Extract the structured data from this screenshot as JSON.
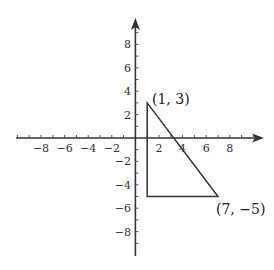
{
  "diagram": {
    "type": "coordinate-plane",
    "x_axis": {
      "range": [
        -9,
        9
      ],
      "tick_labels": [
        "−8",
        "−6",
        "−4",
        "−2",
        "2",
        "4",
        "6",
        "8"
      ],
      "tick_values": [
        -8,
        -6,
        -4,
        -2,
        2,
        4,
        6,
        8
      ]
    },
    "y_axis": {
      "range": [
        -9,
        9
      ],
      "tick_labels": [
        "8",
        "6",
        "4",
        "2",
        "−2",
        "−4",
        "−6",
        "−8"
      ],
      "tick_values": [
        8,
        6,
        4,
        2,
        -2,
        -4,
        -6,
        -8
      ]
    },
    "triangle": {
      "vertices": [
        [
          1,
          3
        ],
        [
          1,
          -5
        ],
        [
          7,
          -5
        ]
      ],
      "stroke_color": "#333333"
    },
    "labels": {
      "top_vertex": "(1, 3)",
      "right_vertex": "(7, −5)"
    },
    "colors": {
      "axis": "#333333",
      "background": "#ffffff"
    }
  }
}
